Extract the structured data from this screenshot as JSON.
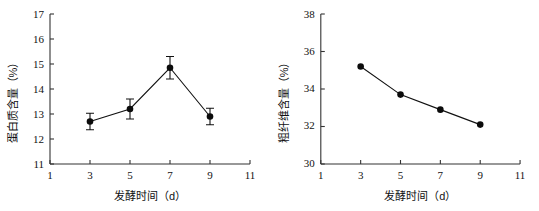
{
  "figure": {
    "panel_count": 2
  },
  "chart_data": [
    {
      "type": "line",
      "panel_id": "left",
      "title": "",
      "xlabel": "发酵时间（d）",
      "ylabel": "蛋白质含量（%）",
      "x": [
        3,
        5,
        7,
        9
      ],
      "values": [
        12.7,
        13.2,
        14.85,
        12.9
      ],
      "errors": [
        0.33,
        0.4,
        0.45,
        0.33
      ],
      "xlim": [
        1,
        11
      ],
      "ylim": [
        11,
        17
      ],
      "xticks": [
        1,
        3,
        5,
        7,
        9,
        11
      ],
      "xtick_labels": [
        "1",
        "3",
        "5",
        "7",
        "9",
        "11"
      ],
      "yticks": [
        11,
        12,
        13,
        14,
        15,
        16,
        17
      ],
      "ytick_labels": [
        "11",
        "12",
        "13",
        "14",
        "15",
        "16",
        "17"
      ],
      "grid": false,
      "legend": "none",
      "marker": "filled-circle",
      "error_bars": true,
      "line_color": "#111111",
      "marker_color": "#0b0b0b"
    },
    {
      "type": "line",
      "panel_id": "right",
      "title": "",
      "xlabel": "发酵时间（d）",
      "ylabel": "粗纤维含量（%）",
      "x": [
        3,
        5,
        7,
        9
      ],
      "values": [
        35.2,
        33.7,
        32.9,
        32.1
      ],
      "errors": [
        0,
        0,
        0,
        0
      ],
      "xlim": [
        1,
        11
      ],
      "ylim": [
        30,
        38
      ],
      "xticks": [
        1,
        3,
        5,
        7,
        9,
        11
      ],
      "xtick_labels": [
        "1",
        "3",
        "5",
        "7",
        "9",
        "11"
      ],
      "yticks": [
        30,
        32,
        34,
        36,
        38
      ],
      "ytick_labels": [
        "30",
        "32",
        "34",
        "36",
        "38"
      ],
      "grid": false,
      "legend": "none",
      "marker": "filled-circle",
      "error_bars": false,
      "line_color": "#111111",
      "marker_color": "#0b0b0b"
    }
  ]
}
